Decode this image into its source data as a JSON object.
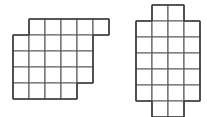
{
  "page": {
    "background_color": "#ffffff",
    "width": 207,
    "height": 117
  },
  "style": {
    "cell_fill": "#ffffff",
    "cell_stroke": "#5a5a5a",
    "outline_stroke": "#3c3c3c",
    "cell_size": 16
  },
  "figures": [
    {
      "name": "left-figure",
      "label": "Left figure",
      "origin_x": 13,
      "origin_y": 19,
      "cell_size": 16,
      "columns": 6,
      "rows": 5,
      "total_cells": 24,
      "rows_data": [
        {
          "row": 1,
          "start_col": 2,
          "count": 5,
          "cells": [
            2,
            3,
            4,
            5,
            6
          ]
        },
        {
          "row": 2,
          "start_col": 1,
          "count": 5,
          "cells": [
            1,
            2,
            3,
            4,
            5
          ]
        },
        {
          "row": 3,
          "start_col": 1,
          "count": 5,
          "cells": [
            1,
            2,
            3,
            4,
            5
          ]
        },
        {
          "row": 4,
          "start_col": 1,
          "count": 5,
          "cells": [
            1,
            2,
            3,
            4,
            5
          ]
        },
        {
          "row": 5,
          "start_col": 1,
          "count": 4,
          "cells": [
            1,
            2,
            3,
            4
          ]
        }
      ]
    },
    {
      "name": "right-figure",
      "label": "Right figure",
      "origin_x": 136,
      "origin_y": 5,
      "cell_size": 16,
      "columns": 4,
      "rows": 7,
      "total_cells": 24,
      "rows_data": [
        {
          "row": 1,
          "start_col": 2,
          "count": 2,
          "cells": [
            2,
            3
          ]
        },
        {
          "row": 2,
          "start_col": 1,
          "count": 4,
          "cells": [
            1,
            2,
            3,
            4
          ]
        },
        {
          "row": 3,
          "start_col": 1,
          "count": 4,
          "cells": [
            1,
            2,
            3,
            4
          ]
        },
        {
          "row": 4,
          "start_col": 1,
          "count": 4,
          "cells": [
            1,
            2,
            3,
            4
          ]
        },
        {
          "row": 5,
          "start_col": 1,
          "count": 4,
          "cells": [
            1,
            2,
            3,
            4
          ]
        },
        {
          "row": 6,
          "start_col": 1,
          "count": 4,
          "cells": [
            1,
            2,
            3,
            4
          ]
        },
        {
          "row": 7,
          "start_col": 2,
          "count": 2,
          "cells": [
            2,
            3
          ]
        }
      ]
    }
  ]
}
